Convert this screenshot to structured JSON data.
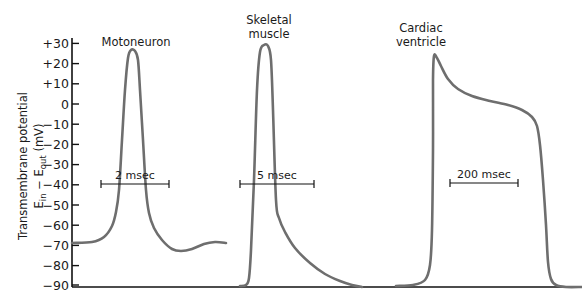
{
  "chart_data": {
    "type": "line",
    "title": "",
    "xlabel": "",
    "ylabel": "Transmembrane potential E_in − E_out (mV)",
    "ylabel_lines": [
      "Transmembrane potential",
      "E",
      "in",
      " − E",
      "out",
      " (mV)"
    ],
    "ylim": [
      -90,
      30
    ],
    "yticks": [
      30,
      20,
      10,
      0,
      -10,
      -20,
      -30,
      -40,
      -50,
      -60,
      -70,
      -80,
      -90
    ],
    "ytick_labels": [
      "+30",
      "+20",
      "+10",
      "0",
      "−10",
      "−20",
      "−30",
      "−40",
      "−50",
      "−60",
      "−70",
      "−80",
      "−90"
    ],
    "grid": false,
    "legend": "none",
    "series": [
      {
        "name": "Motoneuron",
        "title_lines": [
          "Motoneuron"
        ],
        "resting_mV": -70,
        "peak_mV": 26,
        "undershoot_mV": -73,
        "time_scale": "2 msec",
        "points_px": [
          [
            72,
            243
          ],
          [
            92,
            242
          ],
          [
            104,
            237
          ],
          [
            112,
            226
          ],
          [
            116,
            212
          ],
          [
            119,
            190
          ],
          [
            122,
            140
          ],
          [
            125,
            90
          ],
          [
            128,
            58
          ],
          [
            131,
            50
          ],
          [
            135,
            51
          ],
          [
            138,
            60
          ],
          [
            140,
            90
          ],
          [
            143,
            140
          ],
          [
            146,
            190
          ],
          [
            149,
            213
          ],
          [
            154,
            228
          ],
          [
            162,
            240
          ],
          [
            172,
            249
          ],
          [
            181,
            251
          ],
          [
            192,
            249
          ],
          [
            204,
            244
          ],
          [
            215,
            242
          ],
          [
            226,
            243
          ]
        ]
      },
      {
        "name": "Skeletal muscle",
        "title_lines": [
          "Skeletal",
          "muscle"
        ],
        "resting_mV": -90,
        "peak_mV": 29,
        "time_scale": "5 msec",
        "points_px": [
          [
            240,
            286
          ],
          [
            246,
            285
          ],
          [
            249,
            278
          ],
          [
            251,
            250
          ],
          [
            254,
            180
          ],
          [
            257,
            90
          ],
          [
            260,
            52
          ],
          [
            264,
            45
          ],
          [
            268,
            46
          ],
          [
            271,
            60
          ],
          [
            273,
            110
          ],
          [
            276,
            200
          ],
          [
            279,
            218
          ],
          [
            285,
            232
          ],
          [
            295,
            248
          ],
          [
            310,
            263
          ],
          [
            325,
            274
          ],
          [
            340,
            281
          ],
          [
            352,
            285
          ],
          [
            362,
            287
          ]
        ]
      },
      {
        "name": "Cardiac ventricle",
        "title_lines": [
          "Cardiac",
          "ventricle"
        ],
        "resting_mV": -90,
        "peak_mV": 24,
        "plateau_mV": 0,
        "time_scale": "200 msec",
        "points_px": [
          [
            396,
            286
          ],
          [
            413,
            285
          ],
          [
            425,
            280
          ],
          [
            430,
            265
          ],
          [
            432,
            230
          ],
          [
            433,
            150
          ],
          [
            433,
            80
          ],
          [
            434,
            56
          ],
          [
            437,
            58
          ],
          [
            441,
            66
          ],
          [
            448,
            79
          ],
          [
            458,
            89
          ],
          [
            472,
            96
          ],
          [
            490,
            101
          ],
          [
            508,
            105
          ],
          [
            522,
            110
          ],
          [
            532,
            117
          ],
          [
            537,
            126
          ],
          [
            540,
            145
          ],
          [
            543,
            180
          ],
          [
            546,
            225
          ],
          [
            548,
            262
          ],
          [
            551,
            279
          ],
          [
            556,
            285
          ],
          [
            566,
            287
          ],
          [
            582,
            287
          ]
        ]
      }
    ],
    "annotations": [
      {
        "text": "2 msec",
        "bar_x": [
          101,
          169
        ],
        "bar_y": 184
      },
      {
        "text": "5 msec",
        "bar_x": [
          240,
          314
        ],
        "bar_y": 184
      },
      {
        "text": "200 msec",
        "bar_x": [
          450,
          518
        ],
        "bar_y": 183
      }
    ],
    "style": {
      "trace_color": "#6e6e6e",
      "axis_color": "#111111",
      "text_color": "#1a1a1a"
    },
    "layout_px": {
      "axis_x": 72,
      "y_zero": 104,
      "px_per_mV": 2.02,
      "baseline_y": 287,
      "axis_top": 38,
      "x_end": 582
    },
    "title_positions_px": [
      {
        "x": 136,
        "y": [
          46
        ]
      },
      {
        "x": 269,
        "y": [
          24,
          38
        ]
      },
      {
        "x": 421,
        "y": [
          32,
          46
        ]
      }
    ]
  }
}
